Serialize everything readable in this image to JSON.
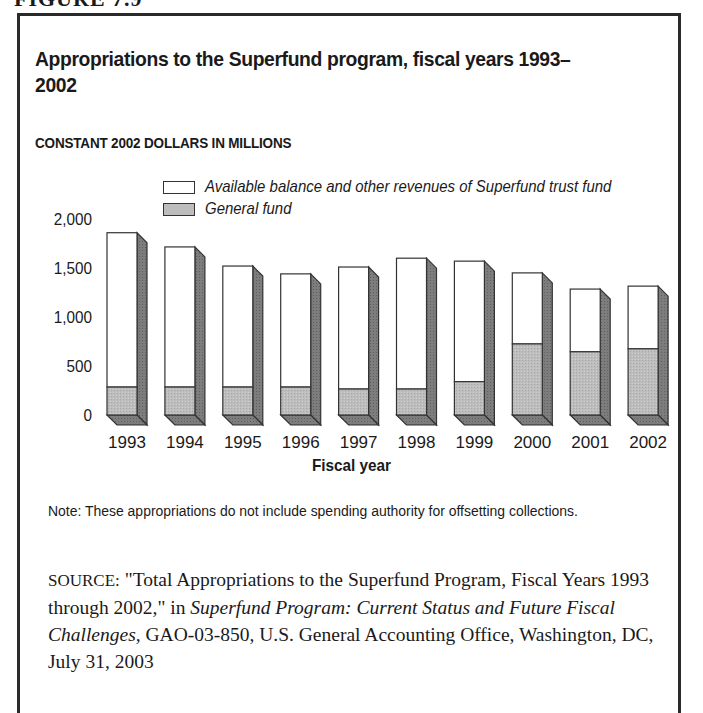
{
  "figure_label": "FIGURE 7.9",
  "title": "Appropriations to the Superfund program, fiscal years 1993–2002",
  "subtitle": "CONSTANT 2002 DOLLARS IN MILLIONS",
  "legend": [
    {
      "label": "Available balance and other revenues of Superfund trust fund",
      "color": "#ffffff"
    },
    {
      "label": "General fund",
      "color": "#bdbdbd"
    }
  ],
  "note": "Note: These appropriations do not include spending authority for offsetting collections.",
  "source": {
    "prefix": "SOURCE:",
    "part1": " \"Total Appropriations to the Superfund Program, Fiscal Years 1993 through 2002,\" in ",
    "italic": "Superfund Program: Current Status and Future Fiscal Challenges,",
    "part2": " GAO-03-850, U.S. General Accounting Office, Washington, DC, July 31, 2003"
  },
  "colors": {
    "trust_fund_face": "#ffffff",
    "general_fund_face": "#bdbdbd",
    "side_face": "#7d7d7d",
    "outline": "#333333"
  },
  "chart_data": {
    "type": "bar",
    "stacked": true,
    "style": "3d",
    "title": "Appropriations to the Superfund program, fiscal years 1993–2002",
    "subtitle": "CONSTANT 2002 DOLLARS IN MILLIONS",
    "xlabel": "Fiscal year",
    "ylabel": "",
    "categories": [
      "1993",
      "1994",
      "1995",
      "1996",
      "1997",
      "1998",
      "1999",
      "2000",
      "2001",
      "2002"
    ],
    "series": [
      {
        "name": "General fund",
        "values": [
          285,
          285,
          285,
          285,
          265,
          265,
          340,
          725,
          645,
          675
        ]
      },
      {
        "name": "Available balance and other revenues of Superfund trust fund",
        "values": [
          1575,
          1430,
          1235,
          1155,
          1245,
          1335,
          1230,
          725,
          640,
          640
        ]
      }
    ],
    "totals": [
      1860,
      1715,
      1520,
      1440,
      1510,
      1600,
      1570,
      1450,
      1285,
      1315
    ],
    "yticks": [
      0,
      500,
      1000,
      1500,
      2000
    ],
    "ytick_labels": [
      "0",
      "500",
      "1,000",
      "1,500",
      "2,000"
    ],
    "ylim": [
      0,
      2000
    ],
    "grid": false,
    "legend_position": "top"
  }
}
